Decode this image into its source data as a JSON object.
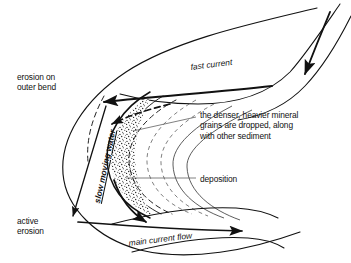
{
  "diagram": {
    "colors": {
      "ink": "#111111",
      "leader": "#555555",
      "stipple": "#1a1a1a",
      "background": "#ffffff"
    },
    "labels": {
      "erosion_outer_bend": "erosion on\nouter bend",
      "active_erosion": "active\nerosion",
      "fast_current": "fast current",
      "slow_moving_water": "slow moving water",
      "main_current_flow": "main current flow",
      "deposition": "deposition",
      "mineral_grains": "the denser, heavier mineral\ngrains are dropped, along\nwith other sediment"
    }
  }
}
